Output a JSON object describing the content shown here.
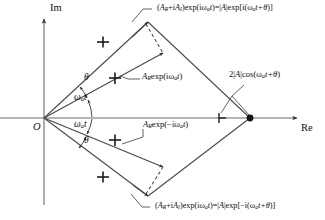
{
  "figure": {
    "type": "phasor-diagram",
    "background": "#ffffff",
    "line_color": "#444444",
    "axis_color": "#666666"
  },
  "axes": {
    "imaginary_label": "Im",
    "real_label": "Re",
    "origin_label": "O",
    "origin_px": [
      44,
      118
    ],
    "real_axis_end_px": [
      300,
      118
    ],
    "imag_axis_top_px": [
      44,
      16
    ]
  },
  "angles": {
    "theta_upper": "θ",
    "omega_upper": "ω",
    "omega_upper_sub": "a",
    "omega_upper_t": "t",
    "omega_lower": "ω",
    "omega_lower_sub": "a",
    "omega_lower_t": "t",
    "theta_lower": "θ"
  },
  "labels": {
    "top_equation": {
      "lhs_open": "(",
      "A": "A",
      "A_sub_R": "R",
      "plus_i": "+i",
      "A2": "A",
      "A2_sub_I": "I",
      "lhs_close": ")exp(i",
      "omega": "ω",
      "omega_sub": "a",
      "t": "t",
      "mid": ")=|",
      "Amag": "A",
      "mid2": "|exp[i(",
      "omega2": "ω",
      "omega2_sub": "a",
      "t2": "t",
      "plus_theta": "+θ",
      "close": ")]",
      "plain": "(Aʀ+iAɪ)exp(iωₐt)=|A|exp[i(ωₐt+θ)]"
    },
    "bottom_equation": {
      "plain": "(Aʀ+iAɪ)exp(iωₐt)=|A|exp[−i(ωₐt+θ)]",
      "minus_i": "−i"
    },
    "upper_vector": {
      "A": "A",
      "A_sub": "R",
      "exp": "exp(i",
      "omega": "ω",
      "omega_sub": "a",
      "t": "t",
      "close": ")",
      "plain": "Aʀexp(iωₐt)"
    },
    "lower_vector": {
      "A": "A",
      "A_sub": "R",
      "exp": "exp(−i",
      "omega": "ω",
      "omega_sub": "a",
      "t": "t",
      "close": ")",
      "plain": "Aʀexp(−iωₐt)"
    },
    "resultant": {
      "two": "2|",
      "A": "A",
      "bar": "|cos(",
      "omega": "ω",
      "omega_sub": "a",
      "t": "t",
      "plus_theta": "+θ",
      "close": ")",
      "plain": "2|A|cos(ωₐt+θ)"
    }
  },
  "geometry": {
    "origin": [
      44,
      118
    ],
    "upper_tip": [
      148,
      22
    ],
    "upper_mid_arrow": [
      163,
      53
    ],
    "upper_cross1": [
      115,
      78
    ],
    "upper_cross2": [
      103,
      42
    ],
    "lower_tip": [
      148,
      196
    ],
    "lower_mid_arrow": [
      163,
      167
    ],
    "lower_cross1": [
      115,
      140
    ],
    "lower_cross2": [
      103,
      177
    ],
    "sum_point": [
      250,
      118
    ],
    "mid_marker": [
      219,
      118
    ]
  },
  "markers": {
    "cross": "plus-tick",
    "sum_dot": "filled-circle",
    "arrow": "arrowhead"
  }
}
